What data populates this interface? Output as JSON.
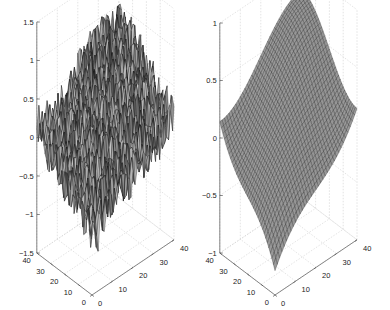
{
  "chart_data": [
    {
      "type": "surface",
      "title": "",
      "description": "Noisy 3D surface (mesh) — saddle-like shape with high-frequency noise",
      "xlabel": "",
      "ylabel": "",
      "zlabel": "",
      "x_ticks": [
        "0",
        "10",
        "20",
        "30",
        "40"
      ],
      "y_ticks": [
        "0",
        "10",
        "20",
        "30",
        "40"
      ],
      "z_ticks": [
        "-1.5",
        "-1",
        "-0.5",
        "0",
        "0.5",
        "1",
        "1.5"
      ],
      "xlim": [
        0,
        40
      ],
      "ylim": [
        0,
        40
      ],
      "zlim": [
        -1.5,
        1.5
      ],
      "grid": true,
      "noise": true,
      "colormap": "gray"
    },
    {
      "type": "surface",
      "title": "",
      "description": "Smooth 3D surface (mesh) — saddle shape, denoised version",
      "xlabel": "",
      "ylabel": "",
      "zlabel": "",
      "x_ticks": [
        "0",
        "10",
        "20",
        "30",
        "40"
      ],
      "y_ticks": [
        "0",
        "10",
        "20",
        "30",
        "40"
      ],
      "z_ticks": [
        "-1",
        "-0.5",
        "0",
        "0.5",
        "1"
      ],
      "xlim": [
        0,
        40
      ],
      "ylim": [
        0,
        40
      ],
      "zlim": [
        -1,
        1
      ],
      "grid": true,
      "noise": false,
      "colormap": "gray"
    }
  ],
  "plots": {
    "left": {
      "z_ticks": [
        "1.5",
        "1",
        "0.5",
        "0",
        "-0.5",
        "-1",
        "-1.5"
      ],
      "y_ticks": [
        "40",
        "30",
        "20",
        "10",
        "0"
      ],
      "x_ticks": [
        "0",
        "10",
        "20",
        "30",
        "40"
      ]
    },
    "right": {
      "z_ticks": [
        "1",
        "0.5",
        "0",
        "-0.5",
        "-1"
      ],
      "y_ticks": [
        "40",
        "30",
        "20",
        "10",
        "0"
      ],
      "x_ticks": [
        "0",
        "10",
        "20",
        "30",
        "40"
      ]
    }
  }
}
